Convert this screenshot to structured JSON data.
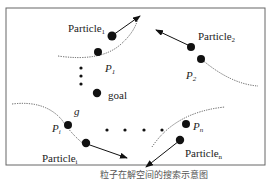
{
  "diagram": {
    "labels": {
      "particle_1": "Particle",
      "particle_1_sub": "1",
      "particle_2": "Particle",
      "particle_2_sub": "2",
      "particle_i": "Particle",
      "particle_i_sub": "i",
      "particle_n": "Particle",
      "particle_n_sub": "n",
      "p1": "P",
      "p1_sub": "1",
      "p2": "P",
      "p2_sub": "2",
      "pi": "P",
      "pi_sub": "i",
      "pn": "P",
      "pn_sub": "n",
      "g": "g",
      "goal": "goal"
    },
    "caption": "粒子在解空间的搜索示意图",
    "colors": {
      "ink": "#111111",
      "frame": "#555555"
    }
  }
}
